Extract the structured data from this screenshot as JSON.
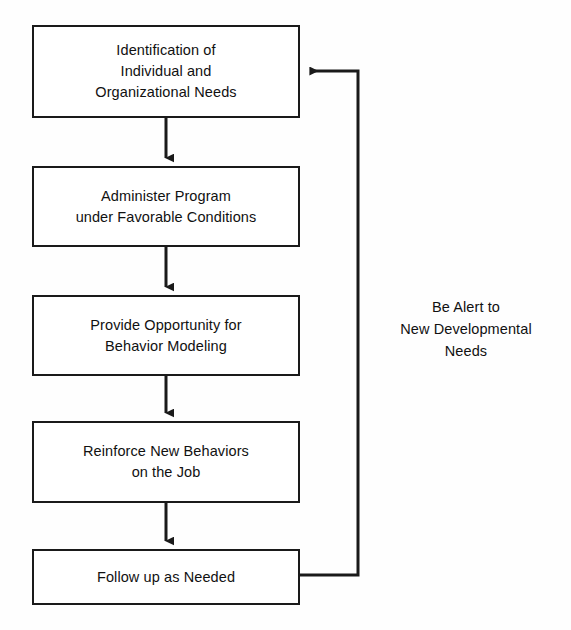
{
  "diagram": {
    "type": "flowchart",
    "title": "",
    "background_color": "#fefefe",
    "line_color": "#1a1a1a",
    "text_color": "#111111",
    "nodes": [
      {
        "id": "identification",
        "label": "Identification of\nIndividual and\nOrganizational Needs",
        "x": 32,
        "y": 25,
        "width": 268,
        "height": 93
      },
      {
        "id": "administer",
        "label": "Administer Program\nunder Favorable Conditions",
        "x": 32,
        "y": 166,
        "width": 268,
        "height": 81
      },
      {
        "id": "provide-opportunity",
        "label": "Provide Opportunity for\nBehavior Modeling",
        "x": 32,
        "y": 295,
        "width": 268,
        "height": 81
      },
      {
        "id": "reinforce",
        "label": "Reinforce New Behaviors\non the Job",
        "x": 32,
        "y": 421,
        "width": 268,
        "height": 82
      },
      {
        "id": "follow-up",
        "label": "Follow up as Needed",
        "x": 32,
        "y": 549,
        "width": 268,
        "height": 56
      }
    ],
    "connectors": [
      {
        "id": "arrow-1-2",
        "from": "identification",
        "to": "administer",
        "kind": "vertical-arrow"
      },
      {
        "id": "arrow-2-3",
        "from": "administer",
        "to": "provide-opportunity",
        "kind": "vertical-arrow"
      },
      {
        "id": "arrow-3-4",
        "from": "provide-opportunity",
        "to": "reinforce",
        "kind": "vertical-arrow"
      },
      {
        "id": "arrow-4-5",
        "from": "reinforce",
        "to": "follow-up",
        "kind": "vertical-arrow"
      },
      {
        "id": "feedback-loop",
        "from": "follow-up",
        "to": "identification",
        "kind": "orthogonal-feedback-arrow"
      }
    ],
    "annotations": [
      {
        "id": "feedback-note",
        "label": "Be Alert to\nNew Developmental\nNeeds",
        "x": 375,
        "y": 296,
        "width": 182
      }
    ]
  }
}
